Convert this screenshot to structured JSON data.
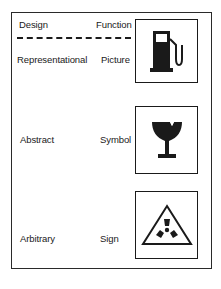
{
  "diagram": {
    "headers": {
      "design": "Design",
      "function": "Function"
    },
    "rows": [
      {
        "design": "Representational",
        "function": "Picture",
        "icon": "fuel-pump-icon"
      },
      {
        "design": "Abstract",
        "function": "Symbol",
        "icon": "broken-glass-icon"
      },
      {
        "design": "Arbitrary",
        "function": "Sign",
        "icon": "radiation-warning-icon"
      }
    ],
    "colors": {
      "ink": "#1a1a1a",
      "background": "#ffffff"
    }
  }
}
